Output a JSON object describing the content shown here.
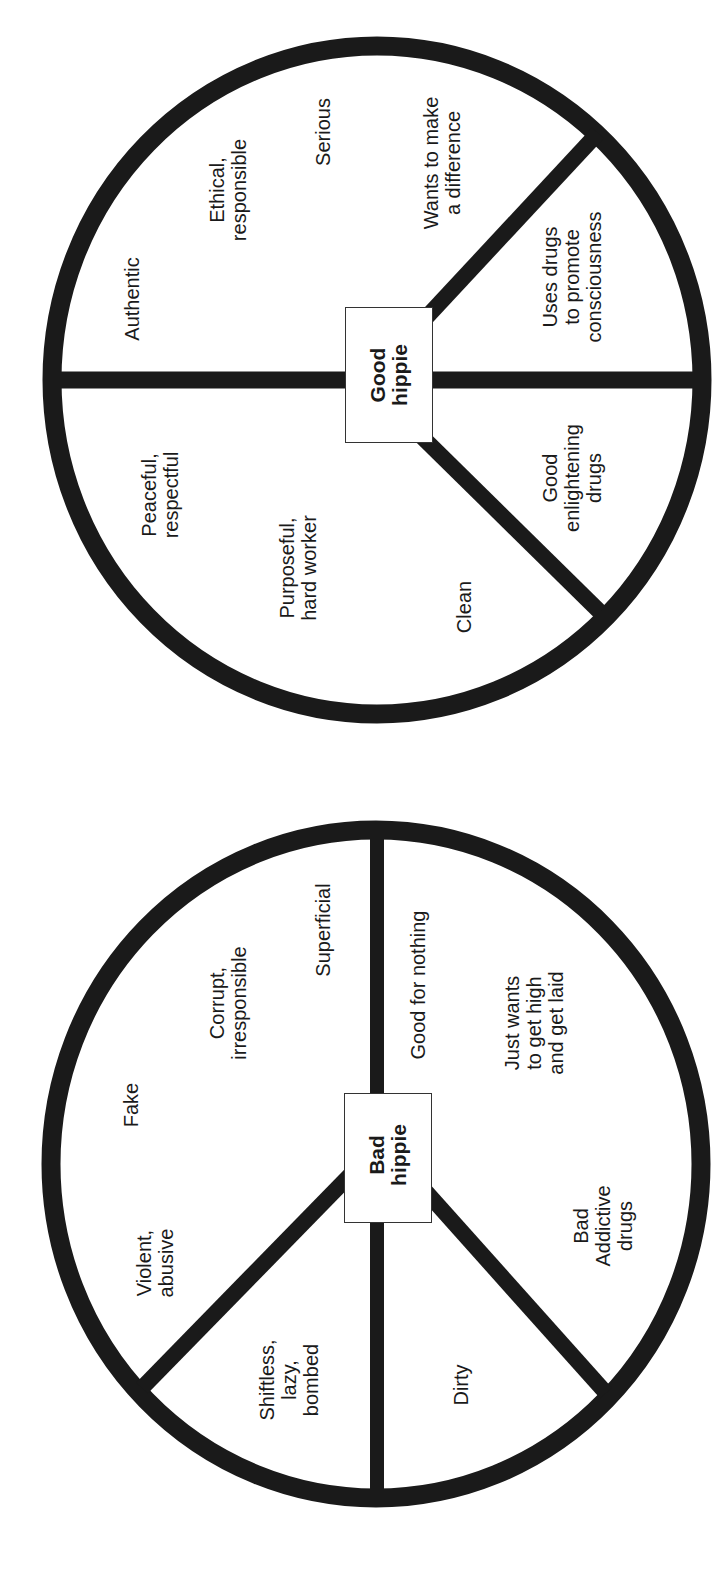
{
  "colors": {
    "stroke": "#1a1a1a",
    "background": "#ffffff",
    "text": "#1a1a1a",
    "box_border": "#333333"
  },
  "diagrams": [
    {
      "name": "good-hippie-peace-sign",
      "center_label": "Good\nhippie",
      "labels": [
        {
          "id": "authentic",
          "text": "Authentic"
        },
        {
          "id": "ethical",
          "text": "Ethical,\nresponsible"
        },
        {
          "id": "serious",
          "text": "Serious"
        },
        {
          "id": "wants-difference",
          "text": "Wants to make\na difference"
        },
        {
          "id": "uses-drugs",
          "text": "Uses drugs\nto promote\nconsciousness"
        },
        {
          "id": "peaceful",
          "text": "Peaceful,\nrespectful"
        },
        {
          "id": "purposeful",
          "text": "Purposeful,\nhard worker"
        },
        {
          "id": "clean",
          "text": "Clean"
        },
        {
          "id": "good-drugs",
          "text": "Good\nenlightening\ndrugs"
        }
      ]
    },
    {
      "name": "bad-hippie-peace-sign",
      "center_label": "Bad\nhippie",
      "labels": [
        {
          "id": "fake",
          "text": "Fake"
        },
        {
          "id": "corrupt",
          "text": "Corrupt,\nirresponsible"
        },
        {
          "id": "superficial",
          "text": "Superficial"
        },
        {
          "id": "good-for-nothing",
          "text": "Good for nothing"
        },
        {
          "id": "just-wants",
          "text": "Just wants\nto get high\nand get laid"
        },
        {
          "id": "violent",
          "text": "Violent,\nabusive"
        },
        {
          "id": "shiftless",
          "text": "Shiftless,\nlazy,\nbombed"
        },
        {
          "id": "dirty",
          "text": "Dirty"
        },
        {
          "id": "bad-drugs",
          "text": "Bad\nAddictive\ndrugs"
        }
      ]
    }
  ]
}
